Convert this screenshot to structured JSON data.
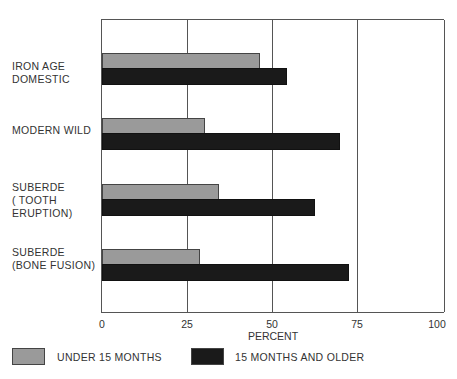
{
  "chart_data": {
    "type": "bar",
    "orientation": "horizontal",
    "title": "",
    "xlabel": "PERCENT",
    "ylabel": "",
    "xlim": [
      0,
      100
    ],
    "xticks": [
      "0",
      "25",
      "50",
      "75",
      "100"
    ],
    "grid": true,
    "categories": [
      "IRON AGE\nDOMESTIC",
      "MODERN WILD",
      "SUBERDE\n(TOOTH\nERUPTION)",
      "SUBERDE\n(BONE FUSION)"
    ],
    "series": [
      {
        "name": "UNDER 15 MONTHS",
        "color": "#9a9a9a",
        "values": [
          46,
          30,
          34,
          28.5
        ]
      },
      {
        "name": "15 MONTHS AND OLDER",
        "color": "#1a1a1a",
        "values": [
          54,
          69.5,
          62,
          72
        ]
      }
    ],
    "legend_position": "bottom"
  }
}
